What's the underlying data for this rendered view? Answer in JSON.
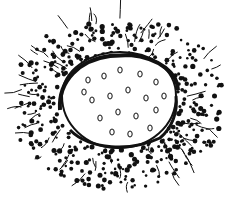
{
  "image": {
    "subject": "ink drawing of an oval cell-like body with small circles inside, surrounded by a ring of black dots and branching lines",
    "colors": {
      "background": "#ffffff",
      "ink": "#111111"
    },
    "oval": {
      "cx": 117,
      "cy": 102,
      "rx": 58,
      "ry": 45
    }
  }
}
